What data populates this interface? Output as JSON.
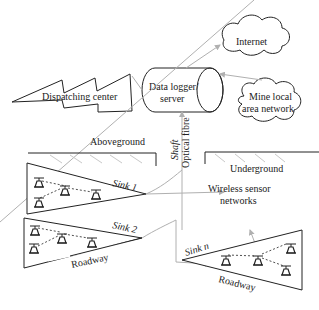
{
  "diagram": {
    "nodes": {
      "dispatching_center": "Dispatching center",
      "data_logger_line1": "Data logger/",
      "data_logger_line2": "server",
      "internet": "Internet",
      "mine_lan_line1": "Mine local",
      "mine_lan_line2": "area network",
      "aboveground": "Aboveground",
      "underground": "Underground",
      "shaft": "Shaft",
      "optical_fibre": "Optical fibre",
      "wsn_line1": "Wireless sensor",
      "wsn_line2": "networks",
      "sink1": "Sink 1",
      "sink2": "Sink 2",
      "sinkn": "Sink n",
      "roadway_left": "Roadway",
      "roadway_right": "Roadway"
    },
    "colors": {
      "line": "#222222",
      "link": "#b0b0b0",
      "hatch": "#c8c8c8"
    }
  }
}
